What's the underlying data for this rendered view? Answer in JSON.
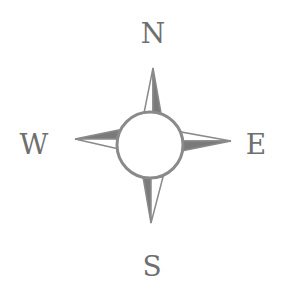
{
  "compass": {
    "labels": {
      "north": "N",
      "south": "S",
      "east": "E",
      "west": "W"
    },
    "colors": {
      "stroke": "#8a8a8a",
      "fill": "#7a7a7a",
      "text": "#6f6f6f",
      "background": "#ffffff"
    }
  }
}
